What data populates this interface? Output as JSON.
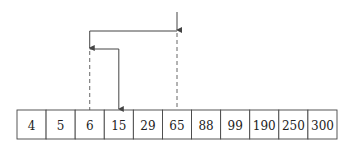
{
  "diagram": {
    "title": "",
    "array": [
      "4",
      "5",
      "6",
      "15",
      "29",
      "65",
      "88",
      "99",
      "190",
      "250",
      "300"
    ],
    "search_steps": [
      {
        "step": 1,
        "probe_index": 5,
        "probe_value": "65",
        "style": "dashed"
      },
      {
        "step": 2,
        "probe_index": 2,
        "probe_value": "6",
        "style": "dashed"
      },
      {
        "step": 3,
        "probe_index": 3,
        "probe_value": "15",
        "style": "solid-arrow"
      }
    ],
    "colors": {
      "stroke": "#444444",
      "text": "#222222",
      "background": "#ffffff"
    }
  }
}
